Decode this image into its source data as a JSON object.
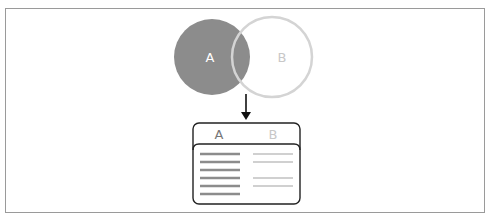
{
  "diagram": {
    "type": "venn-left-join",
    "circles": [
      {
        "label": "A",
        "fill": "#8c8c8c",
        "label_color": "#ffffff",
        "selected": true
      },
      {
        "label": "B",
        "fill": "none",
        "stroke": "#d0d0d0",
        "label_color": "#c8c8c8",
        "selected": false
      }
    ],
    "arrow": {
      "direction": "down",
      "color": "#111111"
    },
    "result_table": {
      "headers": [
        {
          "label": "A",
          "color": "#777777"
        },
        {
          "label": "B",
          "color": "#c8c8c8"
        }
      ],
      "rows_a": 6,
      "rows_b_present": [
        true,
        true,
        false,
        true,
        true,
        false
      ],
      "a_row_color": "#8c8c8c",
      "b_row_color": "#d0d0d0"
    }
  }
}
